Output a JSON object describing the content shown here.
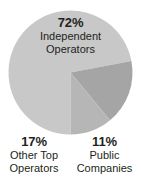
{
  "chart_data": {
    "type": "pie",
    "title": "",
    "categories": [
      "Independent Operators",
      "Other Top Operators",
      "Public Companies"
    ],
    "values": [
      72,
      17,
      11
    ],
    "value_labels": [
      "72%",
      "17%",
      "11%"
    ],
    "colors": [
      "#c8c8c8",
      "#a5a5a5",
      "#b6b6b6"
    ],
    "legend": "none",
    "grid": false,
    "units": "percent",
    "slices": [
      {
        "name": "Independent Operators",
        "percent": 72,
        "percent_label": "72%",
        "label_line1": "Independent",
        "label_line2": "Operators",
        "color": "#c8c8c8",
        "label_position": "inside-top"
      },
      {
        "name": "Other Top Operators",
        "percent": 17,
        "percent_label": "17%",
        "label_line1": "Other Top",
        "label_line2": "Operators",
        "color": "#a5a5a5",
        "label_position": "outside-bottom-left"
      },
      {
        "name": "Public Companies",
        "percent": 11,
        "percent_label": "11%",
        "label_line1": "Public",
        "label_line2": "Companies",
        "color": "#b6b6b6",
        "label_position": "outside-bottom-right"
      }
    ]
  },
  "background_color": "#ffffff",
  "text_color": "#231f20"
}
